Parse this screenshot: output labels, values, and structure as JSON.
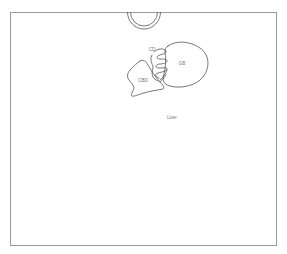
{
  "diagram": {
    "labels": {
      "gallbladder": "GB",
      "cystic_duct": "CD",
      "common_bile_duct": "CBD",
      "liver": "Liver"
    },
    "colors": {
      "outline": "#555555",
      "frame": "#9a9a9a",
      "label": "#777777",
      "background": "#ffffff"
    }
  }
}
